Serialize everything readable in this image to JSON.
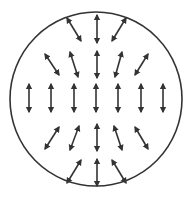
{
  "diagram": {
    "type": "vector-field-in-circle",
    "colors": {
      "stroke": "#333333",
      "background": "#ffffff"
    },
    "circle": {
      "cx": 96,
      "cy": 99,
      "rx": 86,
      "ry": 87
    },
    "arrows": [
      {
        "row": 1,
        "x1": 81,
        "y1": 41,
        "x2": 67,
        "y2": 18
      },
      {
        "row": 1,
        "x1": 97,
        "y1": 43,
        "x2": 97,
        "y2": 15
      },
      {
        "row": 1,
        "x1": 112,
        "y1": 41,
        "x2": 126,
        "y2": 18
      },
      {
        "row": 2,
        "x1": 59,
        "y1": 75,
        "x2": 45,
        "y2": 54
      },
      {
        "row": 2,
        "x1": 78,
        "y1": 77,
        "x2": 70,
        "y2": 52
      },
      {
        "row": 2,
        "x1": 97,
        "y1": 78,
        "x2": 97,
        "y2": 51
      },
      {
        "row": 2,
        "x1": 115,
        "y1": 77,
        "x2": 122,
        "y2": 52
      },
      {
        "row": 2,
        "x1": 135,
        "y1": 75,
        "x2": 148,
        "y2": 54
      },
      {
        "row": 3,
        "x1": 29,
        "y1": 112,
        "x2": 29,
        "y2": 84
      },
      {
        "row": 3,
        "x1": 51,
        "y1": 112,
        "x2": 51,
        "y2": 84
      },
      {
        "row": 3,
        "x1": 74,
        "y1": 112,
        "x2": 74,
        "y2": 84
      },
      {
        "row": 3,
        "x1": 96,
        "y1": 112,
        "x2": 96,
        "y2": 84
      },
      {
        "row": 3,
        "x1": 118,
        "y1": 112,
        "x2": 118,
        "y2": 84
      },
      {
        "row": 3,
        "x1": 141,
        "y1": 112,
        "x2": 141,
        "y2": 84
      },
      {
        "row": 3,
        "x1": 163,
        "y1": 112,
        "x2": 163,
        "y2": 84
      },
      {
        "row": 4,
        "x1": 45,
        "y1": 149,
        "x2": 59,
        "y2": 127
      },
      {
        "row": 4,
        "x1": 70,
        "y1": 150,
        "x2": 79,
        "y2": 126
      },
      {
        "row": 4,
        "x1": 97,
        "y1": 151,
        "x2": 97,
        "y2": 124
      },
      {
        "row": 4,
        "x1": 122,
        "y1": 150,
        "x2": 114,
        "y2": 126
      },
      {
        "row": 4,
        "x1": 148,
        "y1": 149,
        "x2": 135,
        "y2": 127
      },
      {
        "row": 5,
        "x1": 67,
        "y1": 183,
        "x2": 81,
        "y2": 160
      },
      {
        "row": 5,
        "x1": 97,
        "y1": 186,
        "x2": 97,
        "y2": 159
      },
      {
        "row": 5,
        "x1": 126,
        "y1": 183,
        "x2": 112,
        "y2": 160
      }
    ]
  }
}
